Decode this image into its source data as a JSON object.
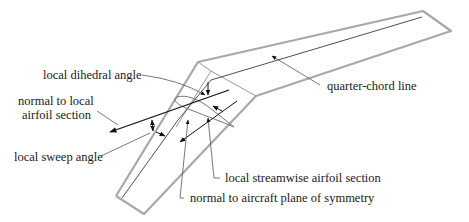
{
  "diagram": {
    "colors": {
      "outline": "#a8a8a8",
      "leader": "#555555",
      "arrow": "#111111",
      "text": "#1a1a1a"
    },
    "labels": {
      "dihedral": "local dihedral angle",
      "normal_airfoil_line1": "normal to local",
      "normal_airfoil_line2": "airfoil section",
      "sweep": "local sweep angle",
      "quarter_chord": "quarter-chord line",
      "streamwise": "local streamwise airfoil section",
      "normal_symmetry": "normal to aircraft plane of symmetry"
    }
  }
}
